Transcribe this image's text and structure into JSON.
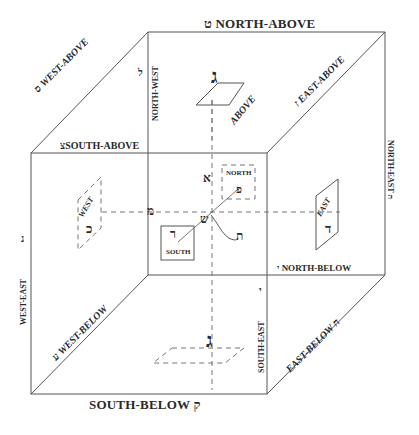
{
  "diagram": {
    "type": "cube-directions",
    "line_color": "#555555",
    "dash_color": "#777777",
    "edges": {
      "top_front": {
        "label": "SOUTH-ABOVE",
        "letter": "צ"
      },
      "top_back": {
        "label": "NORTH-ABOVE",
        "letter": "ט"
      },
      "top_left": {
        "label": "WEST-ABOVE",
        "letter": "ס"
      },
      "top_right": {
        "label": "EAST-ABOVE",
        "letter": "ז"
      },
      "back_left_vertical": {
        "label": "NORTH-WEST",
        "letter": "ל"
      },
      "back_right_vertical": {
        "label": "NORTH-EAST",
        "letter": "ה"
      },
      "front_left_vertical": {
        "label": "WEST-EAST",
        "letter": "נ"
      },
      "front_right_vertical": {
        "label": "SOUTH-EAST",
        "letter": "י"
      },
      "bottom_back": {
        "label": "NORTH-BELOW",
        "letter": "י"
      },
      "bottom_front": {
        "label": "SOUTH-BELOW",
        "letter": "ק"
      },
      "bottom_left": {
        "label": "WEST-BELOW",
        "letter": "ע"
      },
      "bottom_right": {
        "label": "EAST-BELOW",
        "letter": "ח"
      }
    },
    "faces": {
      "above": {
        "label": "ABOVE",
        "letter": "ג"
      },
      "below": {
        "label": "",
        "letter": "ג"
      },
      "north": {
        "label": "NORTH",
        "letter": "פ"
      },
      "south": {
        "label": "SOUTH",
        "letter": "ר"
      },
      "east": {
        "label": "EAST",
        "letter": "ד"
      },
      "west": {
        "label": "WEST",
        "letter": "כ"
      }
    },
    "axes": {
      "vertical_letter": "א",
      "horizontal_letter": "מ",
      "depth_letter": "ש",
      "center_letter": "ת"
    }
  }
}
